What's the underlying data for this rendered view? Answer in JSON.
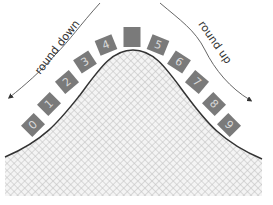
{
  "diagram": {
    "labels": {
      "left_arrow": "round down",
      "right_arrow": "round up"
    },
    "digits": [
      {
        "label": "0",
        "x": 33,
        "y": 125,
        "angle": -45
      },
      {
        "label": "1",
        "x": 49,
        "y": 104,
        "angle": -45
      },
      {
        "label": "2",
        "x": 67,
        "y": 82,
        "angle": -40
      },
      {
        "label": "3",
        "x": 85,
        "y": 62,
        "angle": -33
      },
      {
        "label": "4",
        "x": 106,
        "y": 45,
        "angle": -22
      },
      {
        "label": "",
        "x": 132,
        "y": 37,
        "angle": 0
      },
      {
        "label": "5",
        "x": 158,
        "y": 45,
        "angle": 22
      },
      {
        "label": "6",
        "x": 179,
        "y": 62,
        "angle": 33
      },
      {
        "label": "7",
        "x": 197,
        "y": 82,
        "angle": 40
      },
      {
        "label": "8",
        "x": 214,
        "y": 104,
        "angle": 45
      },
      {
        "label": "9",
        "x": 229,
        "y": 125,
        "angle": 45
      }
    ],
    "colors": {
      "box": "#7a7a7a",
      "digit": "#d8d8d8",
      "curve": "#3a3a3a",
      "hatch": "#c8c8c8",
      "arrow": "#555555"
    }
  }
}
